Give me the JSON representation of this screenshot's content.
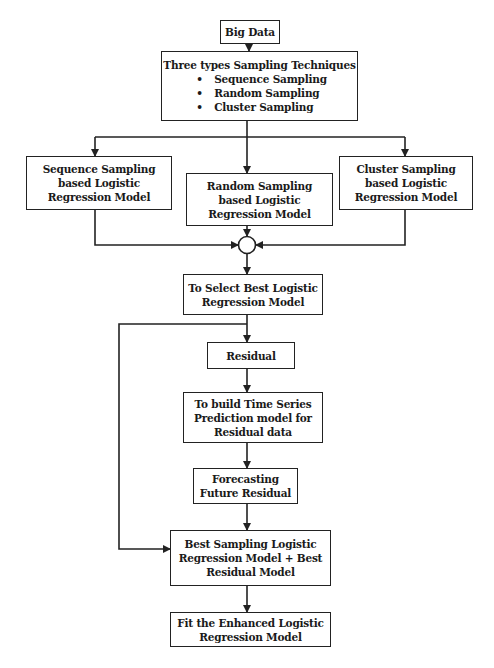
{
  "nodes": {
    "big_data": {
      "lines": [
        "Big Data"
      ]
    },
    "techniques": {
      "title": "Three types Sampling Techniques",
      "bullets": [
        "Sequence Sampling",
        "Random Sampling",
        "Cluster Sampling"
      ]
    },
    "sequence": {
      "lines": [
        "Sequence Sampling",
        "based Logistic",
        "Regression Model"
      ]
    },
    "random": {
      "lines": [
        "Random Sampling",
        "based Logistic",
        "Regression Model"
      ]
    },
    "cluster": {
      "lines": [
        "Cluster Sampling",
        "based Logistic",
        "Regression Model"
      ]
    },
    "select": {
      "lines": [
        "To Select Best Logistic",
        "Regression Model"
      ]
    },
    "residual": {
      "lines": [
        "Residual"
      ]
    },
    "build": {
      "lines": [
        "To build Time Series",
        "Prediction model for",
        "Residual data"
      ]
    },
    "forecast": {
      "lines": [
        "Forecasting",
        "Future Residual"
      ]
    },
    "combined": {
      "lines": [
        "Best Sampling Logistic",
        "Regression Model + Best",
        "Residual Model"
      ]
    },
    "fit": {
      "lines": [
        "Fit the Enhanced Logistic",
        "Regression Model"
      ]
    }
  },
  "colors": {
    "stroke": "#222222",
    "background": "#ffffff"
  }
}
